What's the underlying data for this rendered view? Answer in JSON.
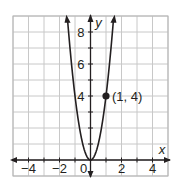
{
  "chart_data": {
    "type": "line",
    "title": "",
    "function": "y = 4x^2",
    "xlabel": "x",
    "ylabel": "y",
    "xlim": [
      -5,
      5
    ],
    "ylim": [
      -1,
      9
    ],
    "grid": true,
    "x_ticks": [
      -4,
      -2,
      0,
      2,
      4
    ],
    "x_tick_labels": [
      "−4",
      "−2",
      "0",
      "2",
      "4"
    ],
    "y_ticks": [
      4,
      6,
      8
    ],
    "y_tick_labels": [
      "4",
      "6",
      "8"
    ],
    "origin_label": "0",
    "series": [
      {
        "name": "parabola",
        "x": [
          -1.5,
          -1,
          -0.5,
          0,
          0.5,
          1,
          1.5
        ],
        "y": [
          9,
          4,
          1,
          0,
          1,
          4,
          9
        ]
      }
    ],
    "annotations": [
      {
        "x": 1,
        "y": 4,
        "label": "(1, 4)",
        "marker": "filled-circle"
      }
    ]
  },
  "colors": {
    "grid": "#c8c8c8",
    "axis": "#231f20",
    "curve": "#231f20",
    "border": "#b5b5b5"
  }
}
